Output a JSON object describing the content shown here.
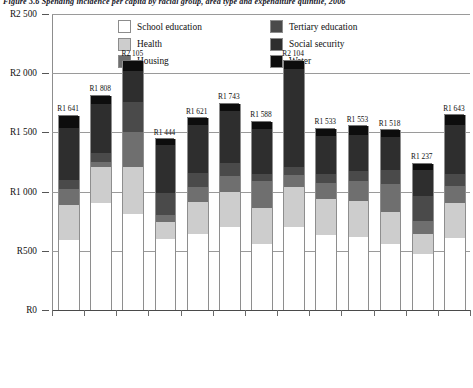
{
  "figure": {
    "title_prefix": "Figure 3.6",
    "title": "Figure 3.6 Spending incidence per capita by racial group, area type and expenditure quintile, 2006"
  },
  "legend": {
    "position": "top-center",
    "columns": [
      {
        "items": [
          {
            "label": "School education",
            "color": "#ffffff",
            "key": "school"
          },
          {
            "label": "Health",
            "color": "#cdcdcd",
            "key": "health"
          },
          {
            "label": "Housing",
            "color": "#6f6f6f",
            "key": "housing"
          }
        ]
      },
      {
        "items": [
          {
            "label": "Tertiary education",
            "color": "#4a4a4a",
            "key": "tertiary"
          },
          {
            "label": "Social security",
            "color": "#2e2e2e",
            "key": "social"
          },
          {
            "label": "Water",
            "color": "#0d0d0d",
            "key": "water"
          }
        ]
      }
    ]
  },
  "yaxis": {
    "ticks": [
      {
        "label": "R2 500",
        "value": 2500
      },
      {
        "label": "R2 000",
        "value": 2000
      },
      {
        "label": "R1 500",
        "value": 1500
      },
      {
        "label": "R1 000",
        "value": 1000
      },
      {
        "label": "R500",
        "value": 500
      },
      {
        "label": "R0",
        "value": 0
      }
    ],
    "min": 0,
    "max": 2500
  },
  "chart_data": {
    "type": "bar",
    "subtype": "stacked",
    "title": "Spending incidence per capita by racial group, area type and expenditure quintile",
    "xlabel": "",
    "ylabel": "",
    "ylim": [
      0,
      2500
    ],
    "grid": true,
    "legend_position": "top-center",
    "categories": [
      "African",
      "Coloured",
      "Asian/Indian",
      "White",
      "Metropolitan",
      "Other urban",
      "Rural",
      "Quintile 1",
      "Quintile 2",
      "Quintile 3",
      "Quintile 4",
      "Quintile 5",
      "Total"
    ],
    "totals": [
      1641,
      1808,
      2105,
      1444,
      1621,
      1743,
      1588,
      2104,
      1533,
      1553,
      1518,
      1237,
      1643
    ],
    "total_labels": [
      "R1 641",
      "R1 808",
      "R2 105",
      "R1 444",
      "R1 621",
      "R1 743",
      "R1 588",
      "R2 104",
      "R1 533",
      "R1 553",
      "R1 518",
      "R1 237",
      "R1 643"
    ],
    "series": [
      {
        "name": "School education",
        "color": "#ffffff",
        "values": [
          595,
          905,
          810,
          600,
          640,
          700,
          560,
          700,
          635,
          620,
          560,
          470,
          610
        ]
      },
      {
        "name": "Health",
        "color": "#cdcdcd",
        "values": [
          295,
          300,
          395,
          145,
          270,
          295,
          305,
          340,
          300,
          300,
          270,
          175,
          290
        ]
      },
      {
        "name": "Housing",
        "color": "#6f6f6f",
        "values": [
          130,
          45,
          300,
          60,
          130,
          135,
          225,
          100,
          135,
          170,
          230,
          110,
          150
        ]
      },
      {
        "name": "Tertiary education",
        "color": "#4a4a4a",
        "values": [
          80,
          80,
          250,
          180,
          120,
          110,
          60,
          70,
          80,
          85,
          120,
          205,
          95
        ]
      },
      {
        "name": "Social security",
        "color": "#2e2e2e",
        "values": [
          440,
          410,
          260,
          410,
          400,
          440,
          375,
          825,
          320,
          300,
          280,
          225,
          415
        ]
      },
      {
        "name": "Water",
        "color": "#0d0d0d",
        "values": [
          101,
          68,
          90,
          49,
          61,
          63,
          63,
          69,
          63,
          78,
          58,
          52,
          83
        ]
      }
    ]
  }
}
